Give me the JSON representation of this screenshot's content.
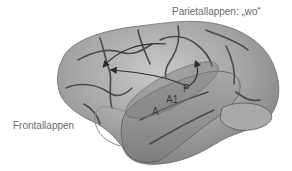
{
  "diagram": {
    "labels": {
      "parietal": "Parietallappen: „wo“",
      "frontal": "Frontallappen",
      "region_a": "A",
      "region_a1": "A1",
      "region_p": "P"
    },
    "colors": {
      "background": "#ffffff",
      "brain_fill": "#9a9a9a",
      "brain_highlight": "#c4c4c4",
      "sulci": "#4a4a4a",
      "arrows": "#2e2e2e",
      "ellipse_overlay": "#7d7d7d",
      "frontal_line": "#888888",
      "label_text": "#6a6a6a"
    }
  }
}
